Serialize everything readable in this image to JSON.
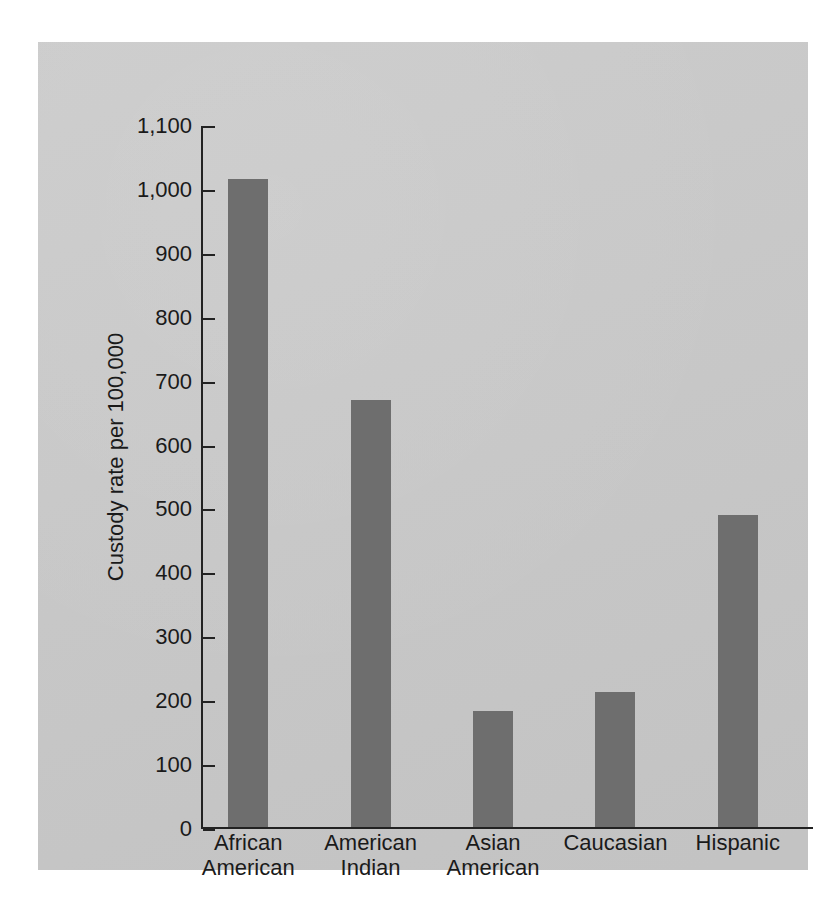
{
  "chart_data": {
    "type": "bar",
    "title": "",
    "xlabel": "",
    "ylabel": "Custody rate per 100,000",
    "categories": [
      "African American",
      "American Indian",
      "Asian American",
      "Caucasian",
      "Hispanic"
    ],
    "category_lines": [
      [
        "African",
        "American"
      ],
      [
        "American",
        "Indian"
      ],
      [
        "Asian",
        "American"
      ],
      [
        "Caucasian",
        ""
      ],
      [
        "Hispanic",
        ""
      ]
    ],
    "values": [
      1014,
      668,
      182,
      212,
      488
    ],
    "ylim": [
      0,
      1100
    ],
    "ytick_step": 100,
    "ytick_labels": [
      "1,100",
      "1,000",
      "900",
      "800",
      "700",
      "600",
      "500",
      "400",
      "300",
      "200",
      "100",
      "0"
    ],
    "ytick_values": [
      1100,
      1000,
      900,
      800,
      700,
      600,
      500,
      400,
      300,
      200,
      100,
      0
    ],
    "grid": false,
    "legend": false,
    "legend_position": "none",
    "colors": {
      "bar": "#6e6e6e",
      "panel_background": "#c9c9c9",
      "page_background": "#ffffff",
      "axis": "#222222",
      "text": "#1a1a1a"
    }
  }
}
